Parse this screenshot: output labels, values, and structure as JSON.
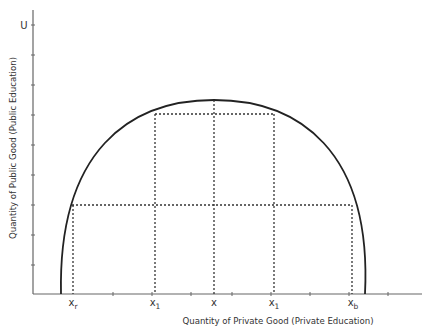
{
  "diagram": {
    "type": "production-possibility-frontier",
    "y_axis_label": "Quantity of Public Good (Public Education)",
    "x_axis_label": "Quantity of Private Good (Private Education)",
    "y_axis_top_label": "U",
    "curve_label": "Production possibility frontier",
    "x_points": [
      {
        "id": "xr",
        "main": "x",
        "sub": "r"
      },
      {
        "id": "x1-left",
        "main": "x",
        "sub": "1"
      },
      {
        "id": "x",
        "main": "x",
        "sub": ""
      },
      {
        "id": "x1-right",
        "main": "x",
        "sub": "1"
      },
      {
        "id": "xb",
        "main": "x",
        "sub": "b"
      }
    ],
    "colors": {
      "axis": "#666666",
      "curve": "#222222",
      "dashed": "#333333",
      "text": "#333333"
    }
  }
}
